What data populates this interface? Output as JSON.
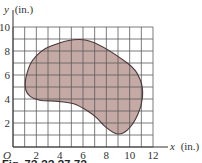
{
  "chart_data": {
    "type": "diagram",
    "title": "",
    "xlabel": "x (in.)",
    "ylabel": "y (in.)",
    "origin_label": "O",
    "xlim": [
      0,
      12
    ],
    "ylim": [
      0,
      10
    ],
    "grid": true,
    "grid_step": 1,
    "x_ticks": [
      2,
      4,
      6,
      8,
      10,
      12
    ],
    "y_ticks": [
      2,
      4,
      6,
      8,
      10
    ],
    "shape": {
      "description": "irregular kidney-shaped shaded region on a 1-inch grid",
      "boundary_points": [
        [
          6.3,
          8.9
        ],
        [
          9.8,
          7.0
        ],
        [
          10.9,
          5.6
        ],
        [
          11.1,
          4.2
        ],
        [
          10.7,
          2.7
        ],
        [
          9.8,
          1.4
        ],
        [
          8.9,
          1.1
        ],
        [
          7.9,
          1.7
        ],
        [
          7.2,
          2.4
        ],
        [
          6.4,
          3.0
        ],
        [
          5.2,
          3.6
        ],
        [
          3.9,
          3.8
        ],
        [
          2.3,
          3.9
        ],
        [
          1.5,
          4.2
        ],
        [
          1.1,
          4.75
        ],
        [
          1.1,
          5.75
        ],
        [
          1.7,
          7.25
        ],
        [
          3.2,
          8.4
        ]
      ]
    }
  },
  "figure": {
    "x_axis_label": "x",
    "x_axis_unit": "(in.)",
    "y_axis_label": "y",
    "y_axis_unit": "(in.)",
    "origin_label": "O",
    "caption_fragment": "Fig. 7?-?? ?7-7?"
  },
  "colors": {
    "fill": "#c4a9a5",
    "outline": "#4a3838",
    "grid": "#5a5a5a",
    "axis": "#333333"
  }
}
